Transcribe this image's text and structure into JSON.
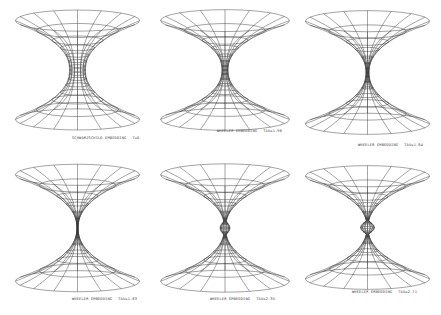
{
  "figure": {
    "panels": [
      {
        "name": "Schwarzschild embedding",
        "label": "SCHWARZSCHILD EMBEDDING",
        "param": "T=0",
        "throat": "open",
        "x": 10,
        "y": 5,
        "w": 135,
        "h": 130,
        "lx": 72,
        "ly": 136,
        "neck": 8,
        "pinch": 0
      },
      {
        "name": "Wheeler embedding 1",
        "label": "WHEELER EMBEDDING",
        "param": "TAU=1.96",
        "throat": "narrow",
        "x": 155,
        "y": 5,
        "w": 140,
        "h": 130,
        "lx": 217,
        "ly": 129,
        "neck": 3,
        "pinch": 0
      },
      {
        "name": "Wheeler embedding 2",
        "label": "WHEELER EMBEDDING",
        "param": "TAU=1.64",
        "throat": "very narrow",
        "x": 300,
        "y": 5,
        "w": 135,
        "h": 135,
        "lx": 358,
        "ly": 143,
        "neck": 1.5,
        "pinch": 0
      },
      {
        "name": "Wheeler embedding 3",
        "label": "WHEELER EMBEDDING",
        "param": "TAU=1.83",
        "throat": "pinched",
        "x": 10,
        "y": 158,
        "w": 135,
        "h": 140,
        "lx": 72,
        "ly": 297,
        "neck": 0.6,
        "pinch": 0
      },
      {
        "name": "Wheeler embedding 4",
        "label": "WHEELER EMBEDDING",
        "param": "TAU=2.35",
        "throat": "pinched bulb",
        "x": 155,
        "y": 158,
        "w": 140,
        "h": 140,
        "lx": 210,
        "ly": 297,
        "neck": 0.5,
        "pinch": 5
      },
      {
        "name": "Wheeler embedding 5",
        "label": "WHEELER EMBEDDING",
        "param": "TAU=2.71",
        "throat": "pinched bulb",
        "x": 300,
        "y": 160,
        "w": 135,
        "h": 135,
        "lx": 352,
        "ly": 290,
        "neck": 0.5,
        "pinch": 7
      }
    ],
    "line_color": "#333333",
    "background": "#ffffff"
  }
}
